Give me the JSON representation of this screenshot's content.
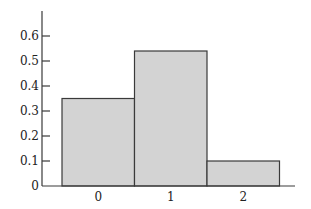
{
  "chart_data": {
    "type": "bar",
    "title": "",
    "xlabel": "",
    "ylabel": "",
    "categories": [
      "0",
      "1",
      "2"
    ],
    "values": [
      0.35,
      0.54,
      0.1
    ],
    "ylim": [
      0,
      0.7
    ],
    "yticks": [
      "0",
      "0.1",
      "0.2",
      "0.3",
      "0.4",
      "0.5",
      "0.6"
    ],
    "ytick_values": [
      0,
      0.1,
      0.2,
      0.3,
      0.4,
      0.5,
      0.6
    ],
    "grid": false,
    "legend": null,
    "bar_width": 1.0,
    "colors": {
      "bar_fill": "#d3d3d3",
      "bar_edge": "#3a3a3a",
      "axis": "#3a3a3a",
      "text": "#222222"
    }
  }
}
